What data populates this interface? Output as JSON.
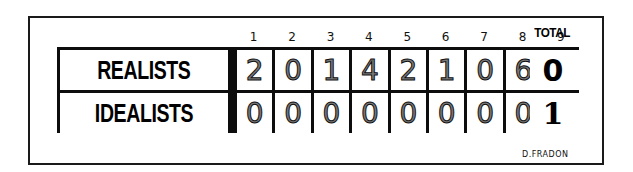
{
  "scoreboard": {
    "innings": [
      "1",
      "2",
      "3",
      "4",
      "5",
      "6",
      "7",
      "8",
      "9"
    ],
    "total_label": "TOTAL",
    "rows": [
      {
        "team": "REALISTS",
        "scores": [
          "2",
          "0",
          "1",
          "4",
          "2",
          "1",
          "0",
          "6",
          "2"
        ],
        "total": "0"
      },
      {
        "team": "IDEALISTS",
        "scores": [
          "0",
          "0",
          "0",
          "0",
          "0",
          "0",
          "0",
          "0",
          "0"
        ],
        "total": "1"
      }
    ]
  },
  "signature": "D.FRADON"
}
